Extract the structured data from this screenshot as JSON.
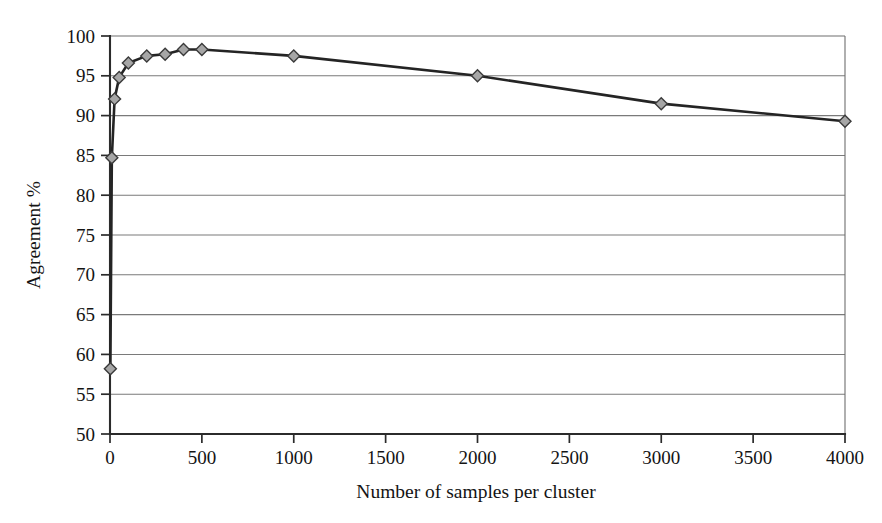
{
  "chart_data": {
    "type": "line",
    "title": "",
    "subtitle": "",
    "xlabel": "Number of samples per cluster",
    "ylabel": "Agreement %",
    "xlim": [
      0,
      4000
    ],
    "ylim": [
      50,
      100
    ],
    "xticks": [
      0,
      500,
      1000,
      1500,
      2000,
      2500,
      3000,
      3500,
      4000
    ],
    "xtick_labels": [
      "0",
      "500",
      "1000",
      "1500",
      "2000",
      "2500",
      "3000",
      "3500",
      "4000"
    ],
    "yticks": [
      50,
      55,
      60,
      65,
      70,
      75,
      80,
      85,
      90,
      95,
      100
    ],
    "ytick_labels": [
      "50",
      "55",
      "60",
      "65",
      "70",
      "75",
      "80",
      "85",
      "90",
      "95",
      "100"
    ],
    "grid": {
      "horizontal": true,
      "vertical": false
    },
    "legend": {
      "visible": false,
      "position": "none",
      "entries": []
    },
    "annotations": [],
    "marker": {
      "shape": "diamond",
      "fill_color": "#a6a6a6",
      "edge_color": "#3a3a3a",
      "size": 11
    },
    "line_color": "#242424",
    "series": [
      {
        "name": "Agreement",
        "x": [
          2,
          10,
          25,
          50,
          100,
          200,
          300,
          400,
          500,
          1000,
          2000,
          3000,
          4000
        ],
        "values": [
          58.2,
          84.7,
          92.1,
          94.8,
          96.6,
          97.5,
          97.7,
          98.3,
          98.3,
          97.5,
          95.0,
          91.5,
          89.3
        ]
      }
    ]
  },
  "figure": {
    "background_color": "#ffffff",
    "width": 882,
    "height": 523
  }
}
